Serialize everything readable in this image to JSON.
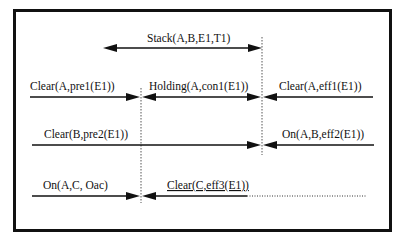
{
  "diagram": {
    "stack": {
      "label": "Stack(A,B,E1,T1)"
    },
    "row1": {
      "left": {
        "label": "Clear(A,pre1(E1))"
      },
      "middle": {
        "label": "Holding(A,con1(E1))"
      },
      "right": {
        "label": "Clear(A,eff1(E1))"
      }
    },
    "row2": {
      "left": {
        "label": "Clear(B,pre2(E1))"
      },
      "right": {
        "label": "On(A,B,eff2(E1))"
      }
    },
    "row3": {
      "left": {
        "label": "On(A,C, Oac)"
      },
      "right": {
        "label": "Clear(C,eff3(E1))"
      }
    }
  },
  "colors": {
    "ink": "#111111",
    "background": "#ffffff"
  }
}
